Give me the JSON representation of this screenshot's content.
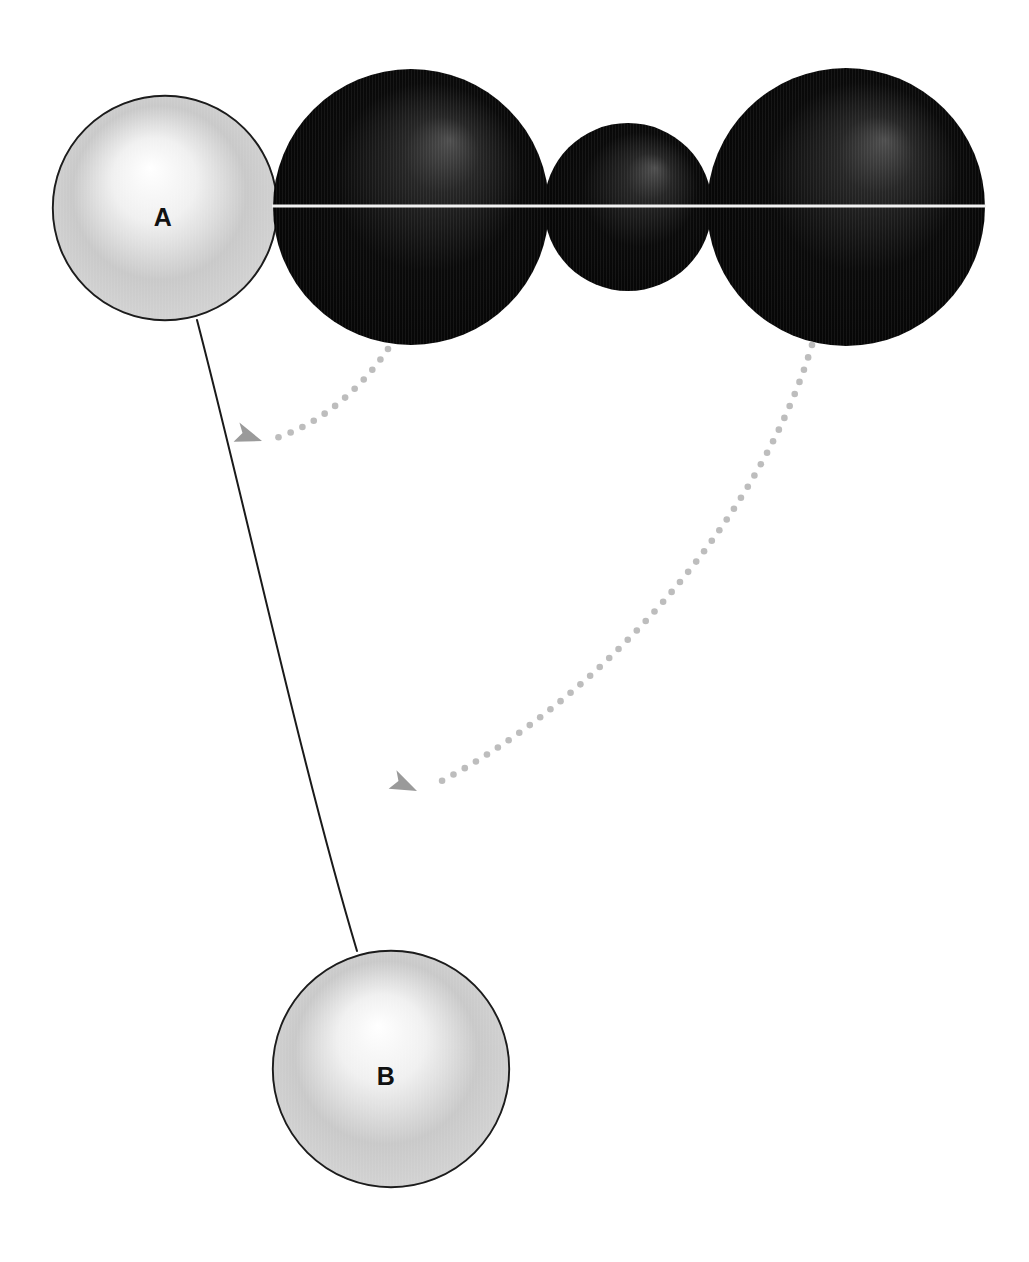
{
  "canvas": {
    "width": 1029,
    "height": 1262,
    "background": "#ffffff"
  },
  "colors": {
    "light_sphere_edge": "#d8d8d8",
    "light_sphere_mid": "#c9c9c9",
    "light_sphere_highlight": "#ffffff",
    "light_sphere_stroke": "#1c1c1c",
    "dark_sphere_base": "#0a0a0a",
    "dark_sphere_highlight": "#4e4e4e",
    "dark_sphere_shadow": "#050505",
    "equator_line": "#f2f2f2",
    "connector_line": "#1a1a1a",
    "dotted_arrow": "#bdbdbd",
    "arrowhead": "#9a9a9a",
    "label_text": "#111111"
  },
  "spheres": [
    {
      "id": "sphere-a",
      "name": "sphere-a-light",
      "label": "A",
      "style": "light",
      "cx": 165,
      "cy": 208,
      "r": 113,
      "highlight_x": 150,
      "highlight_y": 168,
      "label_x": 163,
      "label_y": 217
    },
    {
      "id": "sphere-dark-1",
      "name": "sphere-dark-large-left",
      "label": "",
      "style": "dark",
      "cx": 411,
      "cy": 207,
      "r": 138,
      "highlight_x": 450,
      "highlight_y": 140,
      "label_x": null,
      "label_y": null
    },
    {
      "id": "sphere-dark-2",
      "name": "sphere-dark-small-middle",
      "label": "",
      "style": "dark",
      "cx": 628,
      "cy": 207,
      "r": 84,
      "highlight_x": 655,
      "highlight_y": 168,
      "label_x": null,
      "label_y": null
    },
    {
      "id": "sphere-dark-3",
      "name": "sphere-dark-large-right",
      "label": "",
      "style": "dark",
      "cx": 846,
      "cy": 207,
      "r": 139,
      "highlight_x": 885,
      "highlight_y": 140,
      "label_x": null,
      "label_y": null
    },
    {
      "id": "sphere-b",
      "name": "sphere-b-light",
      "label": "B",
      "style": "light",
      "cx": 391,
      "cy": 1069,
      "r": 119,
      "highlight_x": 378,
      "highlight_y": 1026,
      "label_x": 386,
      "label_y": 1076
    }
  ],
  "equator_line": {
    "name": "equator-line",
    "x1": 272,
    "x2": 986,
    "y": 206,
    "stroke_width": 3.2
  },
  "connector": {
    "name": "connector-a-to-b",
    "path": "M 197 320 C 244 500 300 760 357 951",
    "stroke_width": 2.0
  },
  "dotted_arrows": [
    {
      "id": "arrow-1",
      "name": "dotted-arrow-to-dark-large-left",
      "path": "M 388 349 C 360 390 320 424 276 438",
      "tip_x": 262,
      "tip_y": 441,
      "tip_angle": 197,
      "dot_radius": 3.3,
      "dot_gap": 13
    },
    {
      "id": "arrow-2",
      "name": "dotted-arrow-to-dark-large-right",
      "path": "M 812 345 C 760 520 600 700 434 785",
      "tip_x": 417,
      "tip_y": 791,
      "tip_angle": 203,
      "dot_radius": 3.3,
      "dot_gap": 13
    }
  ]
}
